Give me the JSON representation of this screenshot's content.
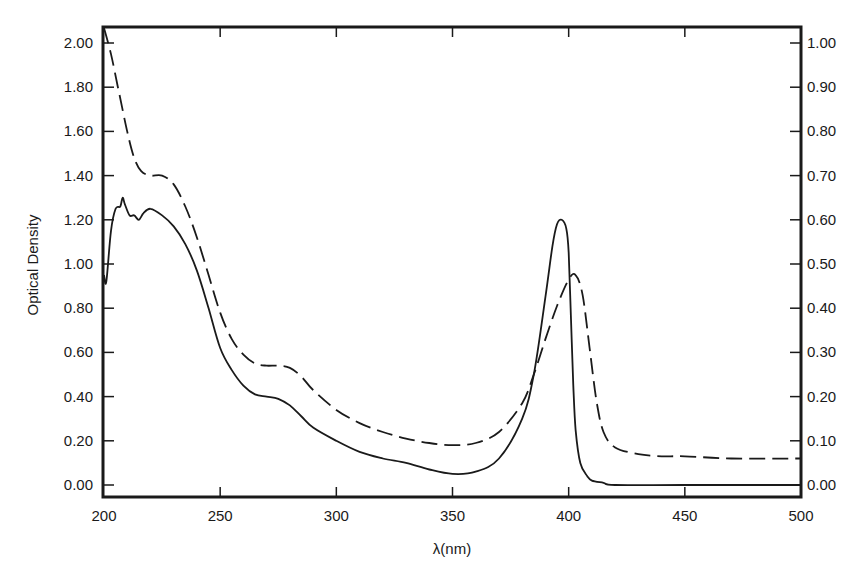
{
  "chart_data": {
    "type": "line",
    "title": "",
    "xlabel": "λ(nm)",
    "ylabel": "Optical Density",
    "xlim": [
      200,
      500
    ],
    "ylim_left": [
      0.0,
      2.0
    ],
    "ylim_right": [
      0.0,
      1.0
    ],
    "x_ticks": [
      "200",
      "250",
      "300",
      "350",
      "400",
      "450",
      "500"
    ],
    "y_ticks_left": [
      "0.00",
      "0.20",
      "0.40",
      "0.60",
      "0.80",
      "1.00",
      "1.20",
      "1.40",
      "1.60",
      "1.80",
      "2.00"
    ],
    "y_ticks_right": [
      "0.00",
      "0.10",
      "0.20",
      "0.30",
      "0.40",
      "0.50",
      "0.60",
      "0.70",
      "0.80",
      "0.90",
      "1.00"
    ],
    "grid": false,
    "legend": null,
    "series": [
      {
        "name": "solid",
        "style": "solid",
        "axis": "left",
        "x": [
          200,
          201,
          203,
          205,
          207,
          208,
          209,
          211,
          213,
          215,
          217,
          220,
          225,
          230,
          235,
          240,
          245,
          250,
          255,
          260,
          265,
          270,
          275,
          280,
          285,
          290,
          300,
          310,
          320,
          330,
          340,
          350,
          360,
          370,
          380,
          385,
          390,
          393,
          395,
          397,
          399,
          400,
          401,
          402,
          403,
          405,
          408,
          410,
          415,
          420,
          450,
          500
        ],
        "y": [
          0.95,
          0.92,
          1.15,
          1.25,
          1.26,
          1.3,
          1.27,
          1.22,
          1.22,
          1.2,
          1.23,
          1.25,
          1.22,
          1.17,
          1.09,
          0.97,
          0.8,
          0.62,
          0.52,
          0.45,
          0.41,
          0.4,
          0.39,
          0.36,
          0.31,
          0.26,
          0.2,
          0.15,
          0.12,
          0.1,
          0.07,
          0.05,
          0.06,
          0.12,
          0.3,
          0.5,
          0.85,
          1.08,
          1.18,
          1.2,
          1.16,
          1.05,
          0.75,
          0.45,
          0.25,
          0.1,
          0.04,
          0.02,
          0.01,
          0.0,
          0.0,
          0.0
        ]
      },
      {
        "name": "dashed",
        "style": "dashed",
        "axis": "left",
        "x": [
          200,
          203,
          206,
          210,
          213,
          216,
          220,
          225,
          230,
          235,
          240,
          245,
          250,
          255,
          260,
          265,
          270,
          275,
          280,
          285,
          290,
          300,
          310,
          320,
          330,
          340,
          350,
          360,
          370,
          380,
          385,
          390,
          395,
          400,
          403,
          406,
          409,
          412,
          415,
          420,
          430,
          440,
          450,
          470,
          500
        ],
        "y": [
          2.08,
          1.95,
          1.8,
          1.6,
          1.48,
          1.42,
          1.4,
          1.4,
          1.36,
          1.26,
          1.12,
          0.95,
          0.78,
          0.66,
          0.59,
          0.55,
          0.54,
          0.54,
          0.53,
          0.49,
          0.43,
          0.34,
          0.28,
          0.24,
          0.21,
          0.19,
          0.18,
          0.19,
          0.24,
          0.37,
          0.5,
          0.66,
          0.81,
          0.93,
          0.95,
          0.86,
          0.62,
          0.38,
          0.24,
          0.17,
          0.14,
          0.13,
          0.13,
          0.12,
          0.12
        ]
      }
    ]
  },
  "axes": {
    "xlabel": "λ(nm)",
    "ylabel": "Optical Density"
  }
}
